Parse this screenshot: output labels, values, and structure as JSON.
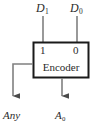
{
  "diagram": {
    "background_color": "#ffffff",
    "line_color": "#4a4a4a",
    "border_color": "#1a1a1a",
    "text_color": "#2b2b2b",
    "block": {
      "name": "Encoder",
      "label": "Encoder",
      "x": 33,
      "y": 42,
      "width": 56,
      "height": 36,
      "fill": "#ffffff"
    },
    "inputs": [
      {
        "name": "D1",
        "label": "D",
        "subscript": "1",
        "port_digit": "1",
        "x": 43
      },
      {
        "name": "D0",
        "label": "D",
        "subscript": "0",
        "port_digit": "0",
        "x": 77
      }
    ],
    "outputs": [
      {
        "name": "Any",
        "label": "Any",
        "subscript": "",
        "side": "left",
        "arrow_x": 13,
        "arrow_tip_y": 103
      },
      {
        "name": "A0",
        "label": "A",
        "subscript": "0",
        "side": "bottom",
        "arrow_x": 62,
        "arrow_tip_y": 103
      }
    ]
  }
}
